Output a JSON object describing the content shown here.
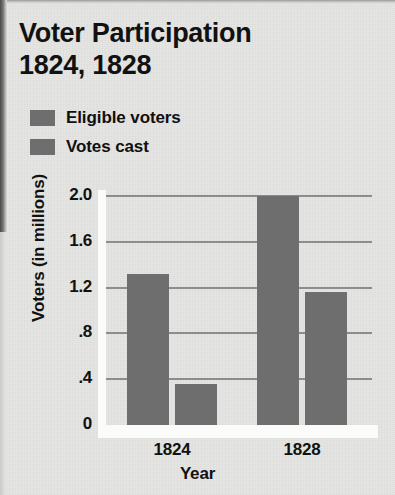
{
  "title": {
    "line1": "Voter Participation",
    "line2": "1824, 1828"
  },
  "colors": {
    "background": "#e4e4e2",
    "bar_eligible": "#6e6e6e",
    "bar_votes": "#6e6e6e",
    "gridline": "#8d8d8d",
    "text": "#111111"
  },
  "legend": {
    "position": "top-left",
    "items": [
      {
        "label": "Eligible voters",
        "color": "#6e6e6e"
      },
      {
        "label": "Votes cast",
        "color": "#6e6e6e"
      }
    ]
  },
  "chart_data": {
    "type": "bar",
    "title": "Voter Participation 1824, 1828",
    "xlabel": "Year",
    "ylabel": "Voters (in millions)",
    "categories": [
      "1824",
      "1828"
    ],
    "series": [
      {
        "name": "Eligible voters",
        "values": [
          1.32,
          2.0
        ]
      },
      {
        "name": "Votes cast",
        "values": [
          0.36,
          1.16
        ]
      }
    ],
    "ylim": [
      0,
      2.0
    ],
    "yticks": [
      0,
      0.4,
      0.8,
      1.2,
      1.6,
      2.0
    ],
    "ytick_labels": [
      "0",
      ".4",
      ".8",
      "1.2",
      "1.6",
      "2.0"
    ],
    "grid": true,
    "legend_position": "top-left"
  }
}
